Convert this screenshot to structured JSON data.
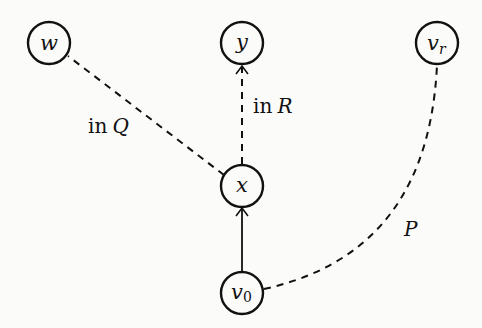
{
  "diagram": {
    "nodes": [
      {
        "id": "w",
        "label": "w",
        "sub": "",
        "cx": 49,
        "cy": 43
      },
      {
        "id": "y",
        "label": "y",
        "sub": "",
        "cx": 242,
        "cy": 43
      },
      {
        "id": "vr",
        "label": "v",
        "sub": "r",
        "cx": 437,
        "cy": 43
      },
      {
        "id": "x",
        "label": "x",
        "sub": "",
        "cx": 242,
        "cy": 186
      },
      {
        "id": "v0",
        "label": "v",
        "sub": "0",
        "cx": 242,
        "cy": 293
      }
    ],
    "edges": [
      {
        "from": "x",
        "to": "w",
        "style": "dashed",
        "arrow": false
      },
      {
        "from": "x",
        "to": "y",
        "style": "dashed",
        "arrow": true
      },
      {
        "from": "v0",
        "to": "x",
        "style": "solid",
        "arrow": true
      },
      {
        "from": "v0",
        "to": "vr",
        "style": "dashed-curve",
        "arrow": false
      }
    ],
    "labels": {
      "in_q": {
        "prefix": "in",
        "var": "Q"
      },
      "in_r": {
        "prefix": "in",
        "var": "R"
      },
      "p": {
        "var": "P"
      }
    }
  }
}
